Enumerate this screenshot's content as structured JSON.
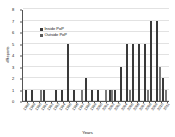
{
  "chart_data": {
    "type": "bar",
    "title": "",
    "xlabel": "Years",
    "ylabel": "#Reports",
    "ylim": [
      0,
      8
    ],
    "yticks": [
      0,
      1,
      2,
      3,
      4,
      5,
      6,
      7,
      8
    ],
    "grid": true,
    "legend_position": "upper-left",
    "categories": [
      "1988",
      "1989",
      "1990",
      "1991",
      "1992",
      "1993",
      "1994",
      "1995",
      "1996",
      "1997",
      "1998",
      "1999",
      "2000",
      "2001",
      "2002",
      "2003",
      "2004",
      "2005",
      "2006",
      "2007",
      "2008",
      "2009",
      "2010",
      "2011"
    ],
    "series": [
      {
        "name": "Inside PoP",
        "color": "#3a3a3a",
        "values": [
          1,
          1,
          0,
          1,
          0,
          1,
          1,
          5,
          1,
          0,
          2,
          1,
          1,
          0,
          1,
          1,
          3,
          5,
          5,
          5,
          5,
          7,
          7,
          2
        ]
      },
      {
        "name": "Outside PoP",
        "color": "#7a7a7a",
        "values": [
          0,
          0,
          1,
          0,
          0,
          0,
          0,
          0,
          0,
          1,
          0,
          0,
          0,
          1,
          1,
          0,
          0,
          1,
          0,
          0,
          1,
          0,
          3,
          1
        ]
      }
    ]
  },
  "legend": {
    "items": [
      {
        "label": "Inside PoP"
      },
      {
        "label": "Outside PoP"
      }
    ]
  },
  "axis": {
    "y_title": "#Reports",
    "x_title": "Years"
  }
}
